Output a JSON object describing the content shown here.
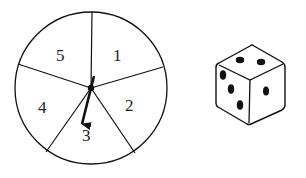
{
  "spinner": {
    "sections": [
      {
        "label": "1",
        "x": 120,
        "y": 60
      },
      {
        "label": "2",
        "x": 132,
        "y": 110
      },
      {
        "label": "3",
        "x": 89,
        "y": 141
      },
      {
        "label": "4",
        "x": 45,
        "y": 112
      },
      {
        "label": "5",
        "x": 63,
        "y": 60
      }
    ],
    "pointer_points_to": "3"
  },
  "die": {
    "top_face_pips": 2,
    "left_face_pips": 3,
    "right_face_pips": 1
  },
  "colors": {
    "stroke": "#111111",
    "background": "#ffffff"
  }
}
